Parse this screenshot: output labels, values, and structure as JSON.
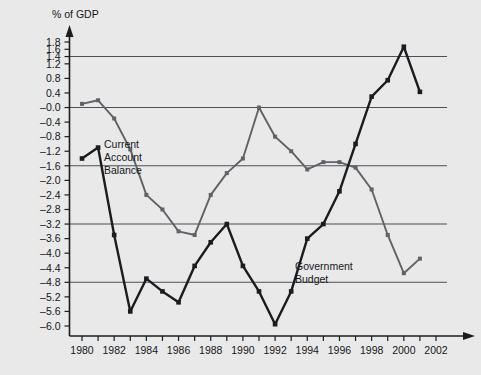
{
  "chart_data": {
    "type": "line",
    "title": "",
    "subtitle": "",
    "xlabel": "",
    "ylabel": "% of GDP",
    "x": [
      1980,
      1981,
      1982,
      1983,
      1984,
      1985,
      1986,
      1987,
      1988,
      1989,
      1990,
      1991,
      1992,
      1993,
      1994,
      1995,
      1996,
      1997,
      1998,
      1999,
      2000,
      2001
    ],
    "xlim": [
      1979.3,
      2002.6
    ],
    "ylim": [
      -6.3,
      2.0
    ],
    "xticks": [
      1980,
      1981,
      1982,
      1983,
      1984,
      1985,
      1986,
      1987,
      1988,
      1989,
      1990,
      1991,
      1992,
      1993,
      1994,
      1995,
      1996,
      1997,
      1998,
      1999,
      2000,
      2001,
      2002
    ],
    "xtick_labels": [
      "1980",
      "",
      "1982",
      "",
      "1984",
      "",
      "1986",
      "",
      "1988",
      "",
      "1990",
      "",
      "1992",
      "",
      "1994",
      "",
      "1996",
      "",
      "1998",
      "",
      "2000",
      "",
      "2002"
    ],
    "yticks": [
      1.8,
      1.6,
      1.4,
      1.2,
      0.8,
      0.4,
      -0.0,
      -0.4,
      -0.8,
      -1.2,
      -1.6,
      -2.0,
      -2.4,
      -2.8,
      -3.2,
      -3.6,
      -4.0,
      -4.4,
      -4.8,
      -5.2,
      -5.6,
      -6.0
    ],
    "ytick_labels": [
      "1.8",
      "1.6",
      "1.4",
      "1.2",
      "0.8",
      "0.4",
      "–0.0",
      "–0.4",
      "–0.8",
      "–1.2",
      "–1.6",
      "–2.0",
      "–2.4",
      "–2.8",
      "–3.2",
      "–3.6",
      "–4.0",
      "–4.4",
      "–4.8",
      "–5.2",
      "–5.6",
      "–6.0"
    ],
    "gridlines_y": [
      1.4,
      -0.0,
      -1.6,
      -3.2,
      -4.8
    ],
    "grid": "horizontal-major-only",
    "legend_position": "inline-annotations",
    "markers": "filled-square",
    "series": [
      {
        "name": "Current Account Balance",
        "color": "#5f6266",
        "values": [
          0.1,
          0.2,
          -0.3,
          -1.15,
          -2.4,
          -2.8,
          -3.4,
          -3.5,
          -2.4,
          -1.8,
          -1.4,
          0.0,
          -0.8,
          -1.2,
          -1.7,
          -1.5,
          -1.5,
          -1.65,
          -2.25,
          -3.5,
          -4.55,
          -4.15
        ],
        "annotation": "Current\nAccount\nBalance",
        "annotation_lines": [
          "Current",
          "Account",
          "Balance"
        ]
      },
      {
        "name": "Government Budget",
        "color": "#1a1c1f",
        "values": [
          -1.4,
          -1.1,
          -3.5,
          -5.6,
          -4.7,
          -5.05,
          -5.35,
          -4.35,
          -3.7,
          -3.2,
          -4.35,
          -5.05,
          -5.95,
          -5.05,
          -3.6,
          -3.2,
          -2.3,
          -1.0,
          0.3,
          0.75,
          1.67,
          0.43
        ],
        "annotation": "Government\nBudget",
        "annotation_lines": [
          "Government",
          "Budget"
        ]
      }
    ]
  },
  "axes": {
    "y_unit_label": "% of GDP",
    "y_axis_arrow": "up-arrow-icon",
    "x_axis_arrow": "right-arrow-icon"
  },
  "annotations": {
    "current_account": {
      "line1": "Current",
      "line2": "Account",
      "line3": "Balance"
    },
    "government_budget": {
      "line1": "Government",
      "line2": "Budget"
    }
  },
  "colors": {
    "background": "#e9e9e9",
    "plot_background": "#e9e9e9",
    "axis": "#1a1c1f",
    "grid": "#4c4f53",
    "series_current_account": "#5f6266",
    "series_government_budget": "#1a1c1f",
    "text": "#15171a"
  }
}
